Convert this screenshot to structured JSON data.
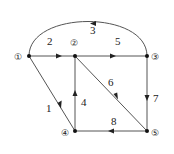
{
  "diagram": {
    "type": "directed-graph",
    "nodes": [
      {
        "id": "1",
        "label": "①",
        "x": 29,
        "y": 56
      },
      {
        "id": "2",
        "label": "②",
        "x": 75,
        "y": 56
      },
      {
        "id": "3",
        "label": "③",
        "x": 147,
        "y": 56
      },
      {
        "id": "4",
        "label": "④",
        "x": 75,
        "y": 131
      },
      {
        "id": "5",
        "label": "⑤",
        "x": 147,
        "y": 131
      }
    ],
    "edges": [
      {
        "label": "1",
        "from": "1",
        "to": "4"
      },
      {
        "label": "2",
        "from": "1",
        "to": "2"
      },
      {
        "label": "3",
        "from": "3",
        "to": "1"
      },
      {
        "label": "4",
        "from": "4",
        "to": "2"
      },
      {
        "label": "5",
        "from": "2",
        "to": "3"
      },
      {
        "label": "6",
        "from": "2",
        "to": "5"
      },
      {
        "label": "7",
        "from": "3",
        "to": "5"
      },
      {
        "label": "8",
        "from": "5",
        "to": "4"
      }
    ],
    "colors": {
      "line": "#555555",
      "node": "#111111"
    }
  }
}
